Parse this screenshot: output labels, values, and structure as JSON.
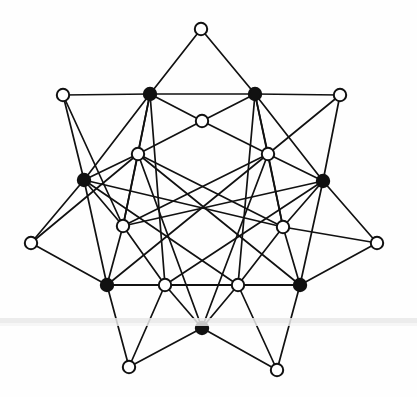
{
  "figure": {
    "background_color": "#fefefe",
    "stroke_color": "#111111",
    "filled_vertex_color": "#111111",
    "open_vertex_fill": "#ffffff",
    "edge_width": 1.7,
    "vertex_radius": 6.2,
    "vertex_stroke_width": 2.0,
    "viewbox": "0 0 417 397"
  },
  "artifact": {
    "scan_line_color": "#e9e9e9",
    "scan_line_top": 318,
    "scan_line_height": 5,
    "scan_line_2_color": "#f4f4f4",
    "scan_line_2_top": 323,
    "scan_line_2_height": 3
  },
  "chart_data": {
    "type": "scatter",
    "xlabel": "",
    "ylabel": "",
    "xlim": [
      0,
      417
    ],
    "ylim": [
      0,
      397
    ],
    "grid": false,
    "legend": "none",
    "vertex_kinds": {
      "filled": "black solid disc",
      "open": "white disc with black outline"
    },
    "vertices": [
      {
        "id": "t",
        "x": 201,
        "y": 29,
        "kind": "open",
        "label": "outer-top"
      },
      {
        "id": "ul",
        "x": 63,
        "y": 95,
        "kind": "open",
        "label": "outer-upper-left"
      },
      {
        "id": "ur",
        "x": 340,
        "y": 95,
        "kind": "open",
        "label": "outer-upper-right"
      },
      {
        "id": "ml",
        "x": 31,
        "y": 243,
        "kind": "open",
        "label": "outer-mid-left"
      },
      {
        "id": "mr",
        "x": 377,
        "y": 243,
        "kind": "open",
        "label": "outer-mid-right"
      },
      {
        "id": "bl",
        "x": 129,
        "y": 367,
        "kind": "open",
        "label": "outer-bottom-left"
      },
      {
        "id": "br",
        "x": 277,
        "y": 370,
        "kind": "open",
        "label": "outer-bottom-right"
      },
      {
        "id": "A",
        "x": 150,
        "y": 94,
        "kind": "filled",
        "label": "ring-top-left"
      },
      {
        "id": "B",
        "x": 255,
        "y": 94,
        "kind": "filled",
        "label": "ring-top-right"
      },
      {
        "id": "C",
        "x": 84,
        "y": 180,
        "kind": "filled",
        "label": "ring-left"
      },
      {
        "id": "D",
        "x": 323,
        "y": 181,
        "kind": "filled",
        "label": "ring-right"
      },
      {
        "id": "E",
        "x": 107,
        "y": 285,
        "kind": "filled",
        "label": "ring-bottom-left"
      },
      {
        "id": "F",
        "x": 300,
        "y": 285,
        "kind": "filled",
        "label": "ring-bottom-right"
      },
      {
        "id": "G",
        "x": 202,
        "y": 328,
        "kind": "filled",
        "label": "ring-bottom"
      },
      {
        "id": "p",
        "x": 202,
        "y": 121,
        "kind": "open",
        "label": "inner-top"
      },
      {
        "id": "q",
        "x": 138,
        "y": 154,
        "kind": "open",
        "label": "inner-upper-left"
      },
      {
        "id": "r",
        "x": 268,
        "y": 154,
        "kind": "open",
        "label": "inner-upper-right"
      },
      {
        "id": "s",
        "x": 123,
        "y": 226,
        "kind": "open",
        "label": "inner-lower-left"
      },
      {
        "id": "u",
        "x": 283,
        "y": 227,
        "kind": "open",
        "label": "inner-lower-right"
      },
      {
        "id": "v",
        "x": 165,
        "y": 285,
        "kind": "open",
        "label": "inner-bottom-left"
      },
      {
        "id": "w",
        "x": 238,
        "y": 285,
        "kind": "open",
        "label": "inner-bottom-right"
      }
    ],
    "edges": [
      [
        "t",
        "A"
      ],
      [
        "t",
        "B"
      ],
      [
        "ul",
        "A"
      ],
      [
        "ul",
        "C"
      ],
      [
        "ul",
        "s"
      ],
      [
        "ur",
        "B"
      ],
      [
        "ur",
        "D"
      ],
      [
        "ur",
        "r"
      ],
      [
        "ml",
        "C"
      ],
      [
        "ml",
        "E"
      ],
      [
        "ml",
        "q"
      ],
      [
        "mr",
        "D"
      ],
      [
        "mr",
        "F"
      ],
      [
        "mr",
        "u"
      ],
      [
        "bl",
        "E"
      ],
      [
        "bl",
        "G"
      ],
      [
        "bl",
        "v"
      ],
      [
        "br",
        "F"
      ],
      [
        "br",
        "G"
      ],
      [
        "br",
        "w"
      ],
      [
        "A",
        "B"
      ],
      [
        "A",
        "C"
      ],
      [
        "A",
        "q"
      ],
      [
        "A",
        "p"
      ],
      [
        "B",
        "D"
      ],
      [
        "B",
        "r"
      ],
      [
        "B",
        "p"
      ],
      [
        "C",
        "q"
      ],
      [
        "C",
        "s"
      ],
      [
        "C",
        "E"
      ],
      [
        "D",
        "r"
      ],
      [
        "D",
        "u"
      ],
      [
        "D",
        "F"
      ],
      [
        "E",
        "s"
      ],
      [
        "E",
        "v"
      ],
      [
        "E",
        "F"
      ],
      [
        "F",
        "u"
      ],
      [
        "F",
        "w"
      ],
      [
        "G",
        "v"
      ],
      [
        "G",
        "w"
      ],
      [
        "A",
        "s"
      ],
      [
        "A",
        "v"
      ],
      [
        "B",
        "u"
      ],
      [
        "B",
        "w"
      ],
      [
        "C",
        "u"
      ],
      [
        "D",
        "s"
      ],
      [
        "E",
        "r"
      ],
      [
        "F",
        "q"
      ],
      [
        "G",
        "q"
      ],
      [
        "G",
        "r"
      ],
      [
        "q",
        "s"
      ],
      [
        "r",
        "u"
      ],
      [
        "s",
        "v"
      ],
      [
        "u",
        "w"
      ],
      [
        "p",
        "q"
      ],
      [
        "p",
        "r"
      ],
      [
        "v",
        "w"
      ],
      [
        "E",
        "w"
      ],
      [
        "F",
        "v"
      ],
      [
        "C",
        "w"
      ],
      [
        "D",
        "v"
      ],
      [
        "q",
        "u"
      ],
      [
        "r",
        "s"
      ]
    ]
  }
}
